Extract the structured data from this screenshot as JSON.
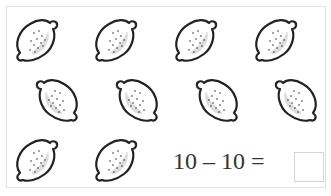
{
  "worksheet": {
    "lemon_count": 10,
    "rows": [
      {
        "count": 4,
        "orientation": "right"
      },
      {
        "count": 4,
        "orientation": "left"
      },
      {
        "count": 2,
        "orientation": "right"
      }
    ],
    "equation": "10 – 10 =",
    "answer": ""
  }
}
